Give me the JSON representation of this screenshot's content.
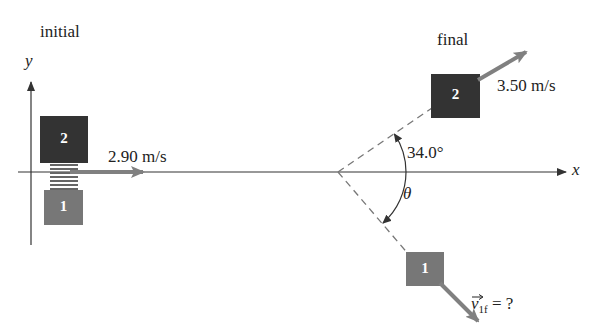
{
  "labels": {
    "initial": "initial",
    "final": "final",
    "y_axis": "y",
    "x_axis": "x",
    "v2_initial": "2.90 m/s",
    "v2_final": "3.50 m/s",
    "angle_upper": "34.0°",
    "angle_lower": "θ",
    "v1f_symbol": "v",
    "v1f_sub": "1f",
    "v1f_rest": " = ?"
  },
  "blocks": {
    "initial_top": {
      "number": "2",
      "color": "#333333"
    },
    "initial_bottom": {
      "number": "1",
      "color": "#777777"
    },
    "final_2": {
      "number": "2",
      "color": "#333333"
    },
    "final_1": {
      "number": "1",
      "color": "#777777"
    }
  },
  "colors": {
    "arrow": "#808080",
    "axis": "#333333",
    "dashed": "#777777"
  }
}
